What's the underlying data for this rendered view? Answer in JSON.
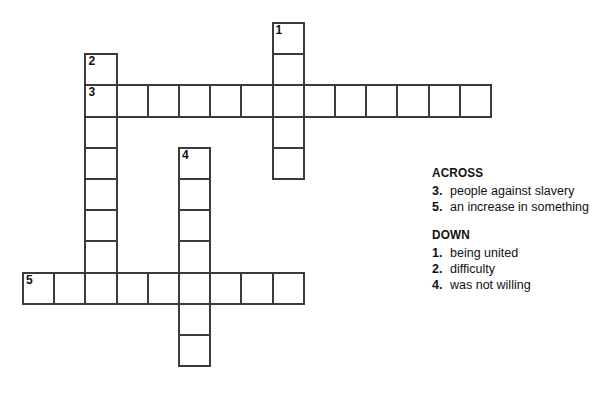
{
  "grid": {
    "cell_size": 31.2,
    "origin_x": 22,
    "origin_y": 22,
    "border_color": "#3b3b3b",
    "cell_background": "#ffffff",
    "entries": [
      {
        "number": "1",
        "direction": "down",
        "col": 8,
        "row": 0,
        "length": 5
      },
      {
        "number": "2",
        "direction": "down",
        "col": 2,
        "row": 1,
        "length": 8
      },
      {
        "number": "3",
        "direction": "across",
        "col": 2,
        "row": 2,
        "length": 13
      },
      {
        "number": "4",
        "direction": "down",
        "col": 5,
        "row": 4,
        "length": 7
      },
      {
        "number": "5",
        "direction": "across",
        "col": 0,
        "row": 8,
        "length": 9
      }
    ]
  },
  "clues": {
    "across": {
      "heading": "ACROSS",
      "items": [
        {
          "number": "3.",
          "text": "people against slavery"
        },
        {
          "number": "5.",
          "text": "an increase in something"
        }
      ]
    },
    "down": {
      "heading": "DOWN",
      "items": [
        {
          "number": "1.",
          "text": "being united"
        },
        {
          "number": "2.",
          "text": "difficulty"
        },
        {
          "number": "4.",
          "text": "was not willing"
        }
      ]
    }
  }
}
